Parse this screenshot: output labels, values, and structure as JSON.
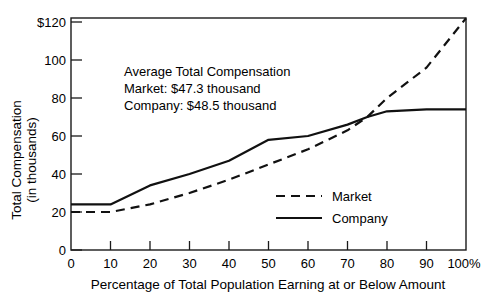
{
  "chart_data": {
    "type": "line",
    "title": "",
    "xlabel": "Percentage of Total Population Earning at or Below Amount",
    "ylabel_line1": "Total Compensation",
    "ylabel_line2": "(in thousands)",
    "xlim": [
      0,
      100
    ],
    "ylim": [
      0,
      125
    ],
    "grid": false,
    "legend_position": "inside-lower-right",
    "x_tick_labels": [
      "0",
      "10",
      "20",
      "30",
      "40",
      "50",
      "60",
      "70",
      "80",
      "90",
      "100%"
    ],
    "x_ticks": [
      0,
      10,
      20,
      30,
      40,
      50,
      60,
      70,
      80,
      90,
      100
    ],
    "y_tick_labels": [
      "0",
      "20",
      "40",
      "60",
      "80",
      "100",
      "$120"
    ],
    "y_ticks": [
      0,
      20,
      40,
      60,
      80,
      100,
      120
    ],
    "x": [
      0,
      10,
      20,
      30,
      40,
      50,
      60,
      70,
      75,
      80,
      90,
      100
    ],
    "series": [
      {
        "name": "Market",
        "style": "dashed",
        "color": "#111111",
        "values": [
          20,
          20,
          24,
          30,
          37,
          45,
          53,
          63,
          70,
          80,
          96,
          122
        ]
      },
      {
        "name": "Company",
        "style": "solid",
        "color": "#111111",
        "values": [
          24,
          24,
          34,
          40,
          47,
          58,
          60,
          66,
          70,
          73,
          74,
          74
        ]
      }
    ],
    "annotations": [
      "Average Total Compensation",
      "Market: $47.3 thousand",
      "Company: $48.5 thousand"
    ],
    "legend_entries": [
      {
        "label": "Market",
        "style": "dashed"
      },
      {
        "label": "Company",
        "style": "solid"
      }
    ]
  }
}
